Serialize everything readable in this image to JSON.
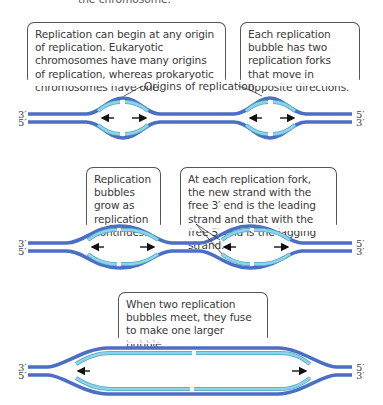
{
  "header": {
    "caption_fragment": "the chromosome."
  },
  "panel1": {
    "callout_left": "Replication can begin at any origin of replication. Eukaryotic chromosomes have many origins of replication, whereas prokaryotic chromosomes have one.",
    "callout_right": "Each replication bubble has two replication forks that move in opposite directions.",
    "origins_label": "Origins of replication",
    "left_labels": [
      "3′",
      "5′"
    ],
    "right_labels": [
      "5′",
      "3′"
    ]
  },
  "panel2": {
    "callout_left": "Replication bubbles grow as replication continues.",
    "callout_right": "At each replication fork, the new strand with the free 3′ end is the leading strand and that with the free 5′ end is the lagging strand.",
    "left_labels": [
      "3′",
      "5′"
    ],
    "right_labels": [
      "5′",
      "3′"
    ]
  },
  "panel3": {
    "callout": "When two replication bubbles meet, they fuse to make one larger bubble.",
    "left_labels": [
      "3′",
      "5′"
    ],
    "right_labels": [
      "5′",
      "3′"
    ]
  },
  "colors": {
    "parental_strand": "#4a6fc4",
    "new_strand": "#8fd3e8",
    "new_strand_edge": "#4aa9c9",
    "arrow": "#111111"
  }
}
